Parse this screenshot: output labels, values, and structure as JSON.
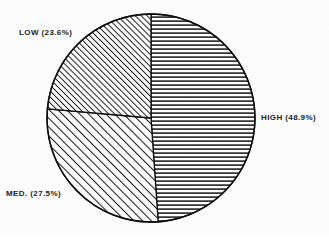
{
  "chart_data": {
    "type": "pie",
    "title": "",
    "subtitle": "",
    "xlabel": "",
    "ylabel": "",
    "legend_position": "none",
    "grid": false,
    "labels_outside": true,
    "value_unit": "percent",
    "total": 100.0,
    "categories": [
      "HIGH",
      "MED.",
      "LOW"
    ],
    "values": [
      48.9,
      27.5,
      23.6
    ],
    "slices": [
      {
        "name": "HIGH",
        "label": "HIGH (48.9%)",
        "value": 48.9,
        "start_angle_deg": 0,
        "end_angle_deg": 176.04,
        "hatch": "horizontal",
        "hatch_spacing_px": 4,
        "color": "#000000",
        "label_side": "right"
      },
      {
        "name": "MED.",
        "label": "MED. (27.5%)",
        "value": 27.5,
        "start_angle_deg": 176.04,
        "end_angle_deg": 275.04,
        "hatch": "diagonal-forward-wide",
        "hatch_spacing_px": 5,
        "color": "#000000",
        "label_side": "bottom-left"
      },
      {
        "name": "LOW",
        "label": "LOW (23.6%)",
        "value": 23.6,
        "start_angle_deg": 275.04,
        "end_angle_deg": 360,
        "hatch": "diagonal-forward-dense",
        "hatch_spacing_px": 3,
        "color": "#000000",
        "label_side": "top-left"
      }
    ],
    "geometry": {
      "center_x": 151,
      "center_y": 118,
      "radius": 104
    },
    "outline_color": "#000000",
    "background_color": "#ffffff"
  },
  "labels": {
    "low": "LOW (23.6%)",
    "high": "HIGH (48.9%)",
    "med": "MED. (27.5%)"
  }
}
